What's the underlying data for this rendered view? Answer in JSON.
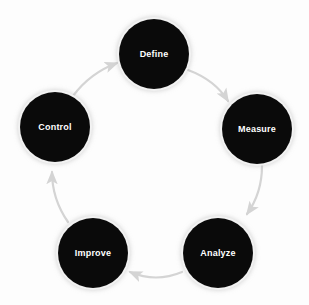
{
  "diagram": {
    "background_color": "#fdfdfd",
    "node_fill_color": "#0a0a0a",
    "node_text_color": "#ffffff",
    "arrow_color": "#d4d4d4",
    "nodes": [
      {
        "id": "define",
        "label": "Define",
        "cx": 154,
        "cy": 54,
        "r": 35
      },
      {
        "id": "measure",
        "label": "Measure",
        "cx": 257,
        "cy": 129,
        "r": 35
      },
      {
        "id": "analyze",
        "label": "Analyze",
        "cx": 218,
        "cy": 253,
        "r": 35
      },
      {
        "id": "improve",
        "label": "Improve",
        "cx": 93,
        "cy": 253,
        "r": 35
      },
      {
        "id": "control",
        "label": "Control",
        "cx": 55,
        "cy": 127,
        "r": 35
      }
    ],
    "arrows": [
      {
        "id": "define-to-measure",
        "from": "define",
        "to": "measure"
      },
      {
        "id": "measure-to-analyze",
        "from": "measure",
        "to": "analyze"
      },
      {
        "id": "analyze-to-improve",
        "from": "analyze",
        "to": "improve"
      },
      {
        "id": "improve-to-control",
        "from": "improve",
        "to": "control"
      },
      {
        "id": "control-to-define",
        "from": "control",
        "to": "define"
      }
    ]
  }
}
